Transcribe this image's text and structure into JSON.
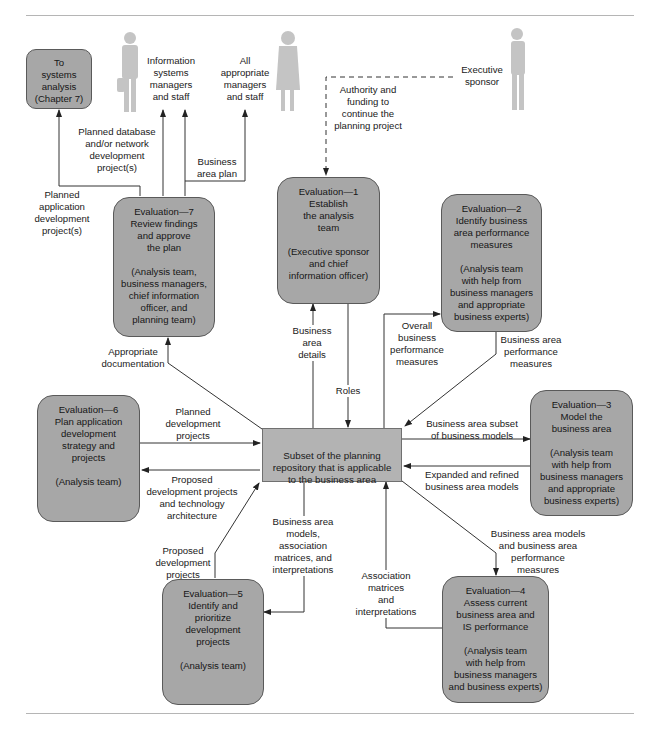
{
  "diagram": {
    "type": "process flow diagram",
    "central": {
      "label": "Subset of the planning\nrepository that is applicable\nto the business area"
    },
    "external_entities": {
      "to_systems_analysis": "To\nsystems\nanalysis\n(Chapter 7)",
      "is_managers": "Information\nsystems\nmanagers\nand staff",
      "all_managers": "All\nappropriate\nmanagers\nand staff",
      "executive_sponsor": "Executive\nsponsor"
    },
    "processes": [
      {
        "id": "eval1",
        "title": "Evaluation—1\nEstablish\nthe analysis\nteam",
        "sub": "(Executive sponsor\nand chief\ninformation officer)"
      },
      {
        "id": "eval2",
        "title": "Evaluation—2\nIdentify business\narea performance\nmeasures",
        "sub": "(Analysis team\nwith help from\nbusiness managers\nand appropriate\nbusiness experts)"
      },
      {
        "id": "eval3",
        "title": "Evaluation—3\nModel the\nbusiness area",
        "sub": "(Analysis team\nwith help from\nbusiness managers\nand appropriate\nbusiness experts)"
      },
      {
        "id": "eval4",
        "title": "Evaluation—4\nAssess current\nbusiness area and\nIS performance",
        "sub": "(Analysis team\nwith help from\nbusiness managers\nand business experts)"
      },
      {
        "id": "eval5",
        "title": "Evaluation—5\nIdentify and\nprioritize\ndevelopment\nprojects",
        "sub": "(Analysis team)"
      },
      {
        "id": "eval6",
        "title": "Evaluation—6\nPlan application\ndevelopment\nstrategy and\nprojects",
        "sub": "(Analysis team)"
      },
      {
        "id": "eval7",
        "title": "Evaluation—7\nReview findings\nand approve\nthe plan",
        "sub": "(Analysis team,\nbusiness managers,\nchief information\nofficer, and\nplanning team)"
      }
    ],
    "flows": {
      "authority_funding": "Authority and\nfunding to\ncontinue the\nplanning project",
      "planned_app_dev": "Planned\napplication\ndevelopment\nproject(s)",
      "planned_db_net": "Planned database\nand/or network\ndevelopment\nproject(s)",
      "business_area_plan": "Business\narea plan",
      "appropriate_documentation": "Appropriate\ndocumentation",
      "business_area_details": "Business\narea\ndetails",
      "roles": "Roles",
      "overall_perf_measures": "Overall\nbusiness\nperformance\nmeasures",
      "ba_perf_measures": "Business area\nperformance\nmeasures",
      "ba_subset_models": "Business area subset\nof business models",
      "expanded_models": "Expanded and refined\nbusiness area models",
      "ba_models_and_perf": "Business area models\nand business area\nperformance\nmeasures",
      "association_matrices": "Association\nmatrices\nand\ninterpretations",
      "ba_models_assoc": "Business area\nmodels,\nassociation\nmatrices, and\ninterpretations",
      "proposed_dev_projects": "Proposed\ndevelopment\nprojects",
      "proposed_dev_tech": "Proposed\ndevelopment projects\nand technology\narchitecture",
      "planned_dev_projects": "Planned\ndevelopment\nprojects"
    },
    "colors": {
      "process_fill": "#a7a7a7",
      "central_fill": "#b3b3b3",
      "person_silhouette": "#c4c4c4",
      "line": "#333333"
    }
  }
}
